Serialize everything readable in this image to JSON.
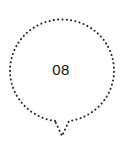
{
  "marker": {
    "label": "08",
    "icon": "dotted-location-pin-icon",
    "outline_color": "#222222",
    "text_color": "#111111",
    "background": "#ffffff"
  }
}
